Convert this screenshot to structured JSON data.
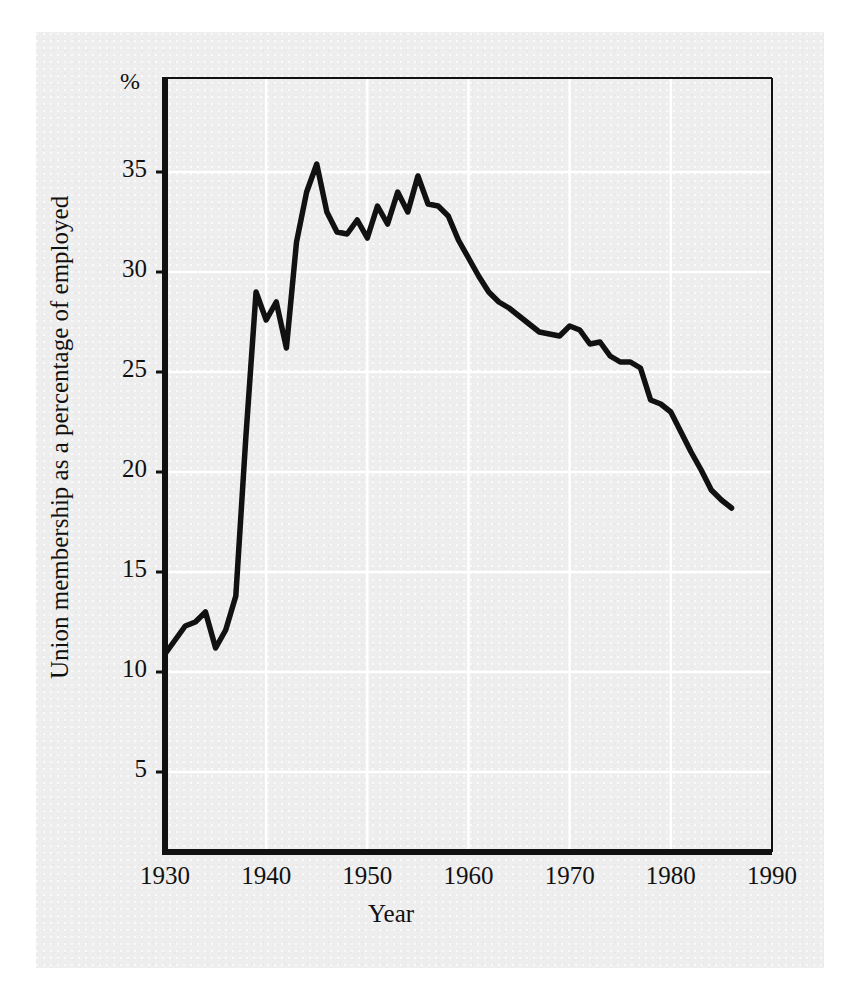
{
  "chart_data": {
    "type": "line",
    "title": "",
    "xlabel": "Year",
    "ylabel": "Union membership as a percentage of employed",
    "y_unit_label": "%",
    "xlim": [
      1930,
      1990
    ],
    "ylim": [
      0,
      37.5
    ],
    "xticks": [
      1930,
      1940,
      1950,
      1960,
      1970,
      1980,
      1990
    ],
    "yticks": [
      5,
      10,
      15,
      20,
      25,
      30,
      35
    ],
    "grid": true,
    "grid_color": "#ffffff",
    "line_color": "#111111",
    "background_color": "#eeeeee",
    "legend": null,
    "series": [
      {
        "name": "Union membership as a percentage of employed",
        "x": [
          1930,
          1931,
          1932,
          1933,
          1934,
          1935,
          1936,
          1937,
          1938,
          1939,
          1940,
          1941,
          1942,
          1943,
          1944,
          1945,
          1946,
          1947,
          1948,
          1949,
          1950,
          1951,
          1952,
          1953,
          1954,
          1955,
          1956,
          1957,
          1958,
          1959,
          1960,
          1961,
          1962,
          1963,
          1964,
          1965,
          1966,
          1967,
          1968,
          1969,
          1970,
          1971,
          1972,
          1973,
          1974,
          1975,
          1976,
          1977,
          1978,
          1979,
          1980,
          1981,
          1982,
          1983,
          1984,
          1985,
          1986
        ],
        "values": [
          10.9,
          11.6,
          12.3,
          12.5,
          13.0,
          11.2,
          12.1,
          13.8,
          21.8,
          29.0,
          27.6,
          28.5,
          26.2,
          31.5,
          34.0,
          35.4,
          33.0,
          32.0,
          31.9,
          32.6,
          31.7,
          33.3,
          32.4,
          34.0,
          33.0,
          34.8,
          33.4,
          33.3,
          32.8,
          31.6,
          30.7,
          29.8,
          29.0,
          28.5,
          28.2,
          27.8,
          27.4,
          27.0,
          26.9,
          26.8,
          27.3,
          27.1,
          26.4,
          26.5,
          25.8,
          25.5,
          25.5,
          25.2,
          23.6,
          23.4,
          23.0,
          22.0,
          21.0,
          20.1,
          19.1,
          18.6,
          18.2
        ]
      }
    ]
  },
  "labels": {
    "percent_symbol": "%",
    "y_title": "Union membership as a percentage of employed",
    "x_title": "Year",
    "x_ticks": [
      "1930",
      "1940",
      "1950",
      "1960",
      "1970",
      "1980",
      "1990"
    ],
    "y_ticks": [
      "35",
      "30",
      "25",
      "20",
      "15",
      "10",
      "5"
    ]
  }
}
